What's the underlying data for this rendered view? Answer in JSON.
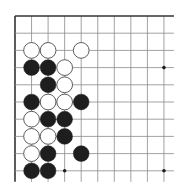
{
  "board": {
    "title": "Go board corner diagram",
    "size": 19,
    "visible_region": "top-left corner",
    "visible_cols": 10,
    "visible_rows": 10,
    "origin": {
      "x": 15,
      "y": 16
    },
    "spacing": {
      "x": 16.55,
      "y": 17.2
    },
    "line_extend": {
      "right": 10,
      "bottom": 11
    },
    "colors": {
      "background": "#ffffff",
      "line": "#8a8a8a",
      "border": "#333333",
      "black_stone": "#1e1e1e",
      "white_stone_fill": "#ffffff",
      "white_stone_stroke": "#4a4a4a",
      "star": "#1e1e1e"
    },
    "star_points": [
      {
        "col": 9,
        "row": 3
      },
      {
        "col": 3,
        "row": 9
      },
      {
        "col": 9,
        "row": 9
      }
    ],
    "stones": [
      {
        "color": "white",
        "col": 1,
        "row": 2
      },
      {
        "color": "white",
        "col": 2,
        "row": 2
      },
      {
        "color": "white",
        "col": 4,
        "row": 2
      },
      {
        "color": "black",
        "col": 1,
        "row": 3
      },
      {
        "color": "black",
        "col": 2,
        "row": 3
      },
      {
        "color": "white",
        "col": 3,
        "row": 3
      },
      {
        "color": "black",
        "col": 2,
        "row": 4
      },
      {
        "color": "white",
        "col": 3,
        "row": 4
      },
      {
        "color": "black",
        "col": 1,
        "row": 5
      },
      {
        "color": "white",
        "col": 2,
        "row": 5
      },
      {
        "color": "white",
        "col": 3,
        "row": 5
      },
      {
        "color": "black",
        "col": 4,
        "row": 5
      },
      {
        "color": "white",
        "col": 1,
        "row": 6
      },
      {
        "color": "black",
        "col": 2,
        "row": 6
      },
      {
        "color": "black",
        "col": 3,
        "row": 6
      },
      {
        "color": "white",
        "col": 1,
        "row": 7
      },
      {
        "color": "white",
        "col": 2,
        "row": 7
      },
      {
        "color": "black",
        "col": 3,
        "row": 7
      },
      {
        "color": "white",
        "col": 1,
        "row": 8
      },
      {
        "color": "black",
        "col": 2,
        "row": 8
      },
      {
        "color": "black",
        "col": 4,
        "row": 8
      },
      {
        "color": "black",
        "col": 1,
        "row": 9
      },
      {
        "color": "black",
        "col": 2,
        "row": 9
      }
    ]
  }
}
